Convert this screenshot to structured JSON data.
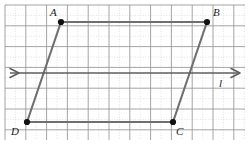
{
  "figure": {
    "width": 249,
    "height": 145,
    "background": "#ffffff"
  },
  "grid": {
    "x0": 5,
    "y0": 5,
    "x1": 245,
    "y1": 140,
    "major_step": 20.8,
    "minor_divisions": 2,
    "major_color": "#9a9a9a",
    "minor_color": "#cfcfcf",
    "major_width": 0.9,
    "minor_width": 0.6,
    "minor_dash": "1,1.6"
  },
  "style": {
    "segment_color": "#6f6f6f",
    "segment_width": 2.1,
    "line_color": "#5e5e5e",
    "line_width": 1.6,
    "vertex_color": "#111111",
    "vertex_radius": 3.1,
    "label_color": "#1a1a1a"
  },
  "vertices": [
    {
      "id": "A",
      "label": "A",
      "x": 61,
      "y": 22,
      "label_x": 50,
      "label_y": 7
    },
    {
      "id": "B",
      "label": "B",
      "x": 207,
      "y": 22,
      "label_x": 213,
      "label_y": 7
    },
    {
      "id": "C",
      "label": "C",
      "x": 173,
      "y": 122,
      "label_x": 176,
      "label_y": 126
    },
    {
      "id": "D",
      "label": "D",
      "x": 27,
      "y": 122,
      "label_x": 11,
      "label_y": 126
    }
  ],
  "segments": [
    {
      "name": "AB",
      "from": "A",
      "to": "B",
      "x1": 61,
      "y1": 22,
      "x2": 207,
      "y2": 22
    },
    {
      "name": "BC",
      "from": "B",
      "to": "C",
      "x1": 207,
      "y1": 22,
      "x2": 173,
      "y2": 122
    },
    {
      "name": "CD",
      "from": "C",
      "to": "D",
      "x1": 173,
      "y1": 122,
      "x2": 27,
      "y2": 122
    },
    {
      "name": "DA",
      "from": "D",
      "to": "A",
      "x1": 27,
      "y1": 122,
      "x2": 61,
      "y2": 22
    }
  ],
  "transversal_line": {
    "name": "line-l",
    "label": "l",
    "x1": 10,
    "x2": 240,
    "y": 73,
    "arrows": "both",
    "label_x": 219,
    "label_y": 78
  }
}
